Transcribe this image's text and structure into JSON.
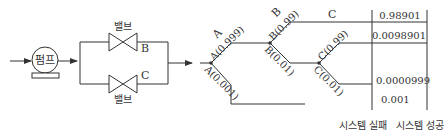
{
  "system_diagram": {
    "pump_label": "펌프",
    "valve_top_label": "밸브",
    "valve_bottom_label": "밸브",
    "valve_top_id": "B",
    "valve_bottom_id": "C"
  },
  "event_tree": {
    "header_a": "A",
    "header_b": "B",
    "header_c": "C",
    "branches": {
      "a_success": "A(0.999)",
      "a_failure": "A(0.001)",
      "b_success": "B(0.99)",
      "b_failure": "B(0.01)",
      "c_success": "C(0.99)",
      "c_failure": "C(0.01)"
    },
    "outcomes": [
      "0.98901",
      "0.0098901",
      "0.0000999",
      "0.001"
    ],
    "column_labels": {
      "failure": "시스템 실패",
      "success": "시스템 성공"
    }
  },
  "colors": {
    "line": "#333333",
    "background": "#ffffff"
  }
}
